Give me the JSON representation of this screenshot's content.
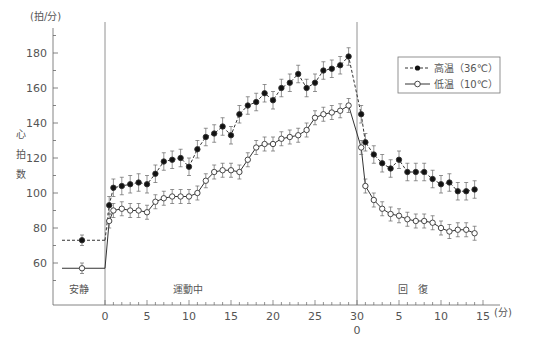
{
  "chart_data": {
    "type": "line",
    "title": "",
    "ylabel": "心拍数",
    "yunit": "(拍/分)",
    "xunit": "(分)",
    "ylim": [
      40,
      195
    ],
    "yticks": [
      60,
      80,
      100,
      120,
      140,
      160,
      180
    ],
    "grid": false,
    "legend_position": "upper-right",
    "phases": [
      {
        "label": "安静",
        "x_range": "rest"
      },
      {
        "label": "運動中",
        "x_range": [
          0,
          30
        ]
      },
      {
        "label": "回　復",
        "x_range": [
          0,
          15
        ]
      }
    ],
    "x_tick_labels_exercise": [
      "0",
      "5",
      "10",
      "15",
      "20",
      "25",
      "30"
    ],
    "x_tick_labels_recovery": [
      "0",
      "5",
      "10",
      "15"
    ],
    "series": [
      {
        "name": "高温（36℃）",
        "marker": "filled-circle",
        "linestyle": "dashed",
        "rest": {
          "value": 73,
          "err": 3
        },
        "exercise_x": [
          0.5,
          1,
          2,
          3,
          4,
          5,
          6,
          7,
          8,
          9,
          10,
          11,
          12,
          13,
          14,
          15,
          16,
          17,
          18,
          19,
          20,
          21,
          22,
          23,
          24,
          25,
          26,
          27,
          28,
          29
        ],
        "exercise_values": [
          93,
          103,
          104,
          105,
          106,
          105,
          111,
          118,
          119,
          120,
          115,
          125,
          132,
          134,
          138,
          133,
          145,
          150,
          152,
          157,
          153,
          160,
          163,
          168,
          160,
          163,
          170,
          171,
          173,
          178
        ],
        "recovery_x": [
          0.5,
          1,
          2,
          3,
          4,
          5,
          6,
          7,
          8,
          9,
          10,
          11,
          12,
          13,
          14
        ],
        "recovery_values": [
          145,
          129,
          122,
          117,
          114,
          119,
          112,
          112,
          112,
          108,
          105,
          106,
          101,
          101,
          102
        ],
        "err": 5
      },
      {
        "name": "低温（10℃）",
        "marker": "open-circle",
        "linestyle": "solid",
        "rest": {
          "value": 57,
          "err": 3
        },
        "exercise_x": [
          0.5,
          1,
          2,
          3,
          4,
          5,
          6,
          7,
          8,
          9,
          10,
          11,
          12,
          13,
          14,
          15,
          16,
          17,
          18,
          19,
          20,
          21,
          22,
          23,
          24,
          25,
          26,
          27,
          28,
          29
        ],
        "exercise_values": [
          84,
          90,
          91,
          90,
          90,
          89,
          95,
          97,
          98,
          98,
          98,
          100,
          107,
          112,
          113,
          113,
          112,
          119,
          126,
          128,
          128,
          131,
          132,
          133,
          136,
          143,
          145,
          146,
          147,
          150,
          154,
          155
        ],
        "recovery_x": [
          0.5,
          1,
          2,
          3,
          4,
          5,
          6,
          7,
          8,
          9,
          10,
          11,
          12,
          13,
          14
        ],
        "recovery_values": [
          126,
          104,
          96,
          91,
          88,
          87,
          85,
          84,
          84,
          83,
          80,
          78,
          79,
          79,
          77
        ],
        "err": 4
      }
    ]
  },
  "labels": {
    "yunit": "(拍/分)",
    "ylabel_chars": [
      "心",
      "拍",
      "数"
    ],
    "rest": "安静",
    "exercise": "運動中",
    "recovery": "回　復",
    "xunit": "(分)",
    "legend_hot": "高温（36℃）",
    "legend_cold": "低温（10℃）"
  }
}
